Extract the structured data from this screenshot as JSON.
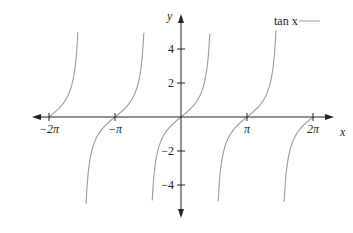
{
  "chart_data": {
    "type": "line",
    "title": "",
    "xlabel": "x",
    "ylabel": "y",
    "legend": [
      {
        "name": "tan x",
        "color": "#9a9a9a"
      }
    ],
    "legend_position": "top-right",
    "grid": false,
    "xlim": [
      -6.9,
      7.1
    ],
    "ylim": [
      -5.9,
      5.9
    ],
    "x_ticks": [
      {
        "value": -6.2832,
        "label": "−2π"
      },
      {
        "value": -3.1416,
        "label": "−π"
      },
      {
        "value": 3.1416,
        "label": "π"
      },
      {
        "value": 6.2832,
        "label": "2π"
      }
    ],
    "y_ticks": [
      {
        "value": 4,
        "label": "4"
      },
      {
        "value": 2,
        "label": "2"
      },
      {
        "value": -2,
        "label": "−2"
      },
      {
        "value": -4,
        "label": "−4"
      }
    ],
    "series": [
      {
        "name": "tan x",
        "function": "tan(x)",
        "y_clip": [
          -5.1,
          5.1
        ],
        "branches": [
          {
            "x_range": [
              -6.2832,
              -4.91
            ]
          },
          {
            "x_range": [
              -4.52,
              -1.77
            ]
          },
          {
            "x_range": [
              -1.37,
              1.37
            ]
          },
          {
            "x_range": [
              1.77,
              4.52
            ]
          },
          {
            "x_range": [
              4.91,
              6.2832
            ]
          }
        ]
      }
    ]
  },
  "labels": {
    "x_axis": "x",
    "y_axis": "y",
    "legend": "tan x"
  }
}
